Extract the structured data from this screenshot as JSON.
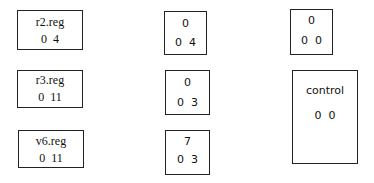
{
  "diagram": {
    "left_column": [
      {
        "label": "r2.reg",
        "values": "0  4"
      },
      {
        "label": "r3.reg",
        "values": "0  11"
      },
      {
        "label": "v6.reg",
        "values": "0  11"
      }
    ],
    "middle_column": [
      {
        "top": "0",
        "values": "0  4"
      },
      {
        "top": "0",
        "values": "0  3"
      },
      {
        "top": "7",
        "values": "0  3"
      }
    ],
    "right_column": [
      {
        "top": "0",
        "values": "0  0"
      },
      {
        "label": "control",
        "values": "0  0"
      }
    ]
  }
}
